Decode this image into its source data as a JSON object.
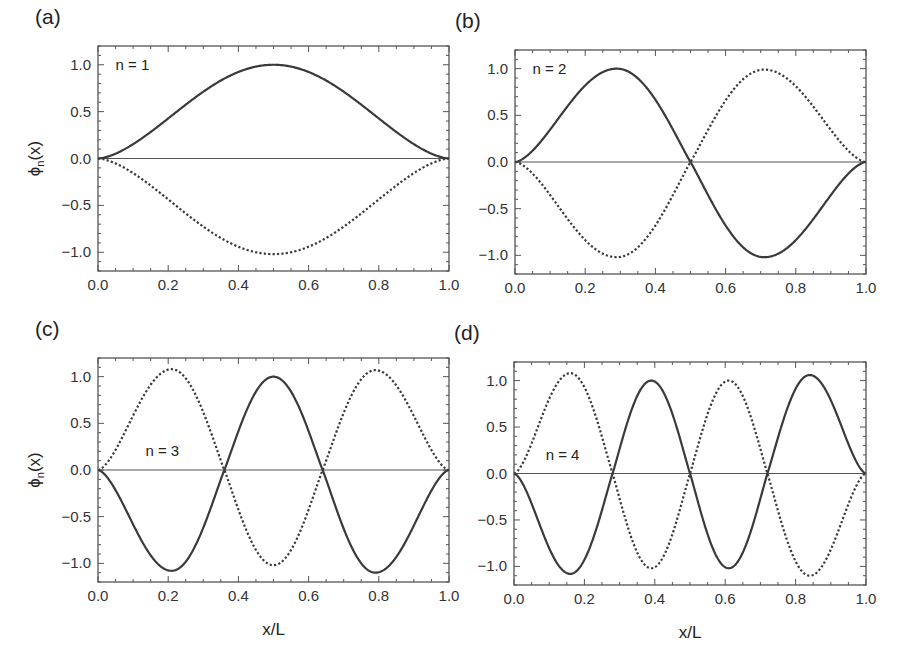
{
  "figure": {
    "width": 908,
    "height": 670,
    "colors": {
      "curve": "#3a3a3a",
      "frame": "#555555",
      "zero_line": "#555555",
      "text": "#2a2a2a"
    }
  },
  "chart_data": [
    {
      "type": "line",
      "panel_label": "(a)",
      "annotation": "n = 1",
      "annotation_pos": [
        0.05,
        1.0
      ],
      "xlabel": "",
      "ylabel": "ϕn(x)",
      "show_ylabel": true,
      "xlim": [
        0,
        1
      ],
      "ylim": [
        -1.2,
        1.2
      ],
      "xticks": [
        "0.0",
        "0.2",
        "0.4",
        "0.6",
        "0.8",
        "1.0"
      ],
      "yticks": [
        "-1.0",
        "-0.5",
        "0.0",
        "0.5",
        "1.0"
      ],
      "frame": [
        98,
        46,
        449,
        271
      ],
      "nodes": [
        0.0,
        1.0
      ],
      "series": [
        {
          "name": "solid",
          "style": "solid",
          "peaks": [
            [
              0.5,
              1.0
            ]
          ]
        },
        {
          "name": "dotted",
          "style": "dotted",
          "peaks": [
            [
              0.5,
              -1.02
            ]
          ]
        }
      ]
    },
    {
      "type": "line",
      "panel_label": "(b)",
      "annotation": "n = 2",
      "annotation_pos": [
        0.05,
        1.0
      ],
      "xlabel": "",
      "ylabel": "",
      "show_ylabel": false,
      "xlim": [
        0,
        1
      ],
      "ylim": [
        -1.2,
        1.2
      ],
      "xticks": [
        "0.0",
        "0.2",
        "0.4",
        "0.6",
        "0.8",
        "1.0"
      ],
      "yticks": [
        "-1.0",
        "-0.5",
        "0.0",
        "0.5",
        "1.0"
      ],
      "frame": [
        515,
        50,
        866,
        274
      ],
      "nodes": [
        0.0,
        0.5,
        1.0
      ],
      "series": [
        {
          "name": "solid",
          "style": "solid",
          "peaks": [
            [
              0.29,
              1.0
            ],
            [
              0.71,
              -1.02
            ]
          ]
        },
        {
          "name": "dotted",
          "style": "dotted",
          "peaks": [
            [
              0.29,
              -1.02
            ],
            [
              0.71,
              0.99
            ]
          ]
        }
      ]
    },
    {
      "type": "line",
      "panel_label": "(c)",
      "annotation": "n = 3",
      "annotation_pos": [
        0.135,
        0.2
      ],
      "xlabel": "x/L",
      "ylabel": "ϕn(x)",
      "show_ylabel": true,
      "xlim": [
        0,
        1
      ],
      "ylim": [
        -1.2,
        1.2
      ],
      "xticks": [
        "0.0",
        "0.2",
        "0.4",
        "0.6",
        "0.8",
        "1.0"
      ],
      "yticks": [
        "-1.0",
        "-0.5",
        "0.0",
        "0.5",
        "1.0"
      ],
      "frame": [
        98,
        358,
        449,
        582
      ],
      "nodes": [
        0.0,
        0.36,
        0.64,
        1.0
      ],
      "series": [
        {
          "name": "solid",
          "style": "solid",
          "peaks": [
            [
              0.21,
              -1.08
            ],
            [
              0.5,
              1.0
            ],
            [
              0.79,
              -1.1
            ]
          ]
        },
        {
          "name": "dotted",
          "style": "dotted",
          "peaks": [
            [
              0.21,
              1.08
            ],
            [
              0.5,
              -1.02
            ],
            [
              0.79,
              1.07
            ]
          ]
        }
      ]
    },
    {
      "type": "line",
      "panel_label": "(d)",
      "annotation": "n = 4",
      "annotation_pos": [
        0.09,
        0.2
      ],
      "xlabel": "x/L",
      "ylabel": "",
      "show_ylabel": false,
      "xlim": [
        0,
        1
      ],
      "ylim": [
        -1.2,
        1.2
      ],
      "xticks": [
        "0.0",
        "0.2",
        "0.4",
        "0.6",
        "0.8",
        "1.0"
      ],
      "yticks": [
        "-1.0",
        "-0.5",
        "0.0",
        "0.5",
        "1.0"
      ],
      "frame": [
        514,
        362,
        866,
        585
      ],
      "nodes": [
        0.0,
        0.28,
        0.5,
        0.72,
        1.0
      ],
      "series": [
        {
          "name": "solid",
          "style": "solid",
          "peaks": [
            [
              0.16,
              -1.08
            ],
            [
              0.39,
              1.0
            ],
            [
              0.61,
              -1.02
            ],
            [
              0.84,
              1.06
            ]
          ]
        },
        {
          "name": "dotted",
          "style": "dotted",
          "peaks": [
            [
              0.16,
              1.08
            ],
            [
              0.39,
              -1.02
            ],
            [
              0.61,
              1.0
            ],
            [
              0.84,
              -1.1
            ]
          ]
        }
      ]
    }
  ]
}
